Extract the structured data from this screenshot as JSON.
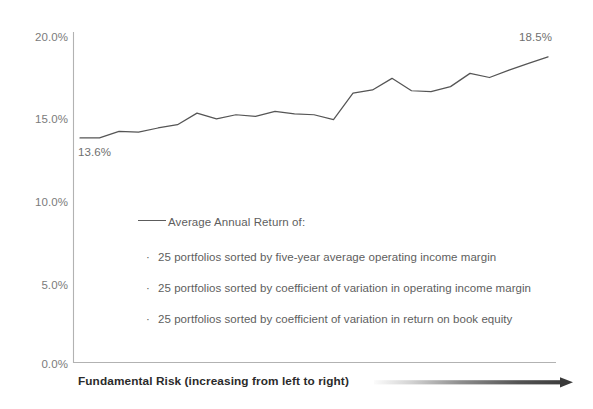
{
  "chart_data": {
    "type": "line",
    "title": "",
    "subtitle": "",
    "xlabel": "Fundamental Risk (increasing from left to right)",
    "ylabel": "",
    "ylim": [
      0.0,
      20.0
    ],
    "yticks": [
      "0.0%",
      "5.0%",
      "10.0%",
      "15.0%",
      "20.0%"
    ],
    "ytick_values": [
      0.0,
      5.0,
      10.0,
      15.0,
      20.0
    ],
    "ytick_format": "percent",
    "xticks": [],
    "grid": false,
    "legend_position": "inside-center",
    "x": [
      1,
      2,
      3,
      4,
      5,
      6,
      7,
      8,
      9,
      10,
      11,
      12,
      13,
      14,
      15,
      16,
      17,
      18,
      19,
      20,
      21,
      22,
      23,
      24,
      25
    ],
    "series": [
      {
        "name": "Average Annual Return of:",
        "color": "#555555",
        "values": [
          13.6,
          13.6,
          14.0,
          13.95,
          14.2,
          14.4,
          15.1,
          14.75,
          15.0,
          14.9,
          15.2,
          15.05,
          15.0,
          14.7,
          16.3,
          16.5,
          17.2,
          16.45,
          16.4,
          16.7,
          17.5,
          17.25,
          17.7,
          18.1,
          18.5
        ]
      }
    ],
    "annotations": [
      {
        "name": "start-value",
        "text": "13.6%",
        "value": 13.6,
        "position": "below-left-endpoint"
      },
      {
        "name": "end-value",
        "text": "18.5%",
        "value": 18.5,
        "position": "above-right-endpoint"
      }
    ],
    "legend": {
      "header": "Average  Annual Return of:",
      "items": [
        "25 portfolios sorted by five-year average operating income margin",
        "25 portfolios sorted by coefficient of variation in operating income margin",
        "25 portfolios sorted by coefficient of variation in return on book equity"
      ],
      "bullet": "·"
    },
    "colors": {
      "line": "#555555",
      "axis": "#b0b0b0",
      "tick_text": "#7b7b7b",
      "legend_text": "#5e5e5e",
      "caption_text": "#2b2b2b",
      "arrow_dark": "#3a3a3a",
      "arrow_light": "#f2f2f2",
      "background": "#ffffff"
    }
  },
  "axis": {
    "yticks": [
      {
        "label": "20.0%",
        "value": 20.0
      },
      {
        "label": "15.0%",
        "value": 15.0
      },
      {
        "label": "10.0%",
        "value": 10.0
      },
      {
        "label": "5.0%",
        "value": 5.0
      },
      {
        "label": "0.0%",
        "value": 0.0
      }
    ]
  },
  "caption": {
    "text": "Fundamental Risk (increasing from left to right)",
    "arrow_name": "risk-gradient-arrow"
  }
}
